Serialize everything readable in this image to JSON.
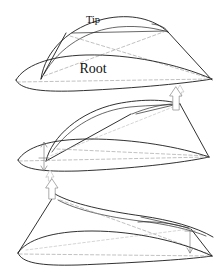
{
  "figure": {
    "background_color": "#ffffff",
    "line_color": "#1a1a1a",
    "hidden_line_color": "#9a9a9a",
    "arrow_color": "#8c8c8c",
    "width": 222,
    "height": 278
  },
  "labels": {
    "tip": "Tip",
    "root": "Root"
  },
  "panels": [
    {
      "id": "panel-untwisted",
      "name": "untwisted-wing",
      "order": 1,
      "description": "Wing planform with root airfoil section and tip airfoil section, no twist",
      "labels": [
        "Tip",
        "Root"
      ],
      "arrows": [
        {
          "name": "reference-marker-arrow",
          "direction": "up",
          "style": "hollow-faint",
          "location": "trailing-edge-right"
        }
      ]
    },
    {
      "id": "panel-washin",
      "name": "wing-twist-up",
      "order": 2,
      "description": "Wing with tip leading edge deflected upward relative to root",
      "labels": [],
      "arrows": [
        {
          "name": "tip-up-arrow",
          "direction": "up",
          "style": "hollow",
          "location": "tip"
        },
        {
          "name": "root-double-arrow",
          "direction": "up-down",
          "style": "thin",
          "location": "root"
        },
        {
          "name": "reference-marker-arrow",
          "direction": "up",
          "style": "hollow-faint",
          "location": "below-root"
        }
      ]
    },
    {
      "id": "panel-washout",
      "name": "wing-twist-down",
      "order": 3,
      "description": "Wing with root deflected upward and tip deflected downward",
      "labels": [],
      "arrows": [
        {
          "name": "root-up-arrow",
          "direction": "up",
          "style": "hollow",
          "location": "root-apex"
        },
        {
          "name": "tip-down-arrow",
          "direction": "down",
          "style": "thin",
          "location": "tip"
        }
      ]
    }
  ]
}
